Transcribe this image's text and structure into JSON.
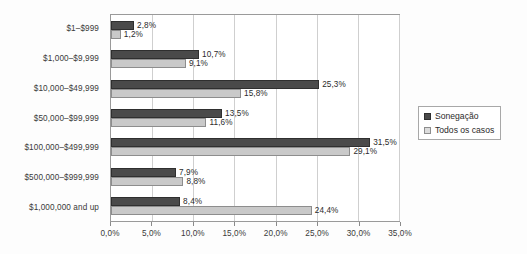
{
  "chart_data": {
    "type": "bar",
    "orientation": "horizontal",
    "title": "",
    "subtitle": "",
    "xlabel": "",
    "ylabel": "",
    "xlim": [
      0,
      35
    ],
    "grid": true,
    "legend_position": "right",
    "categories": [
      "$1–$999",
      "$1,000–$9,999",
      "$10,000–$49,999",
      "$50,000–$99,999",
      "$100,000–$499,999",
      "$500,000–$999,999",
      "$1,000,000 and up"
    ],
    "xticks": [
      0,
      5,
      10,
      15,
      20,
      25,
      30,
      35
    ],
    "xtick_labels": [
      "0,0%",
      "5,0%",
      "10,0%",
      "15,0%",
      "20,0%",
      "25,0%",
      "30,0%",
      "35,0%"
    ],
    "series": [
      {
        "name": "Sonegação",
        "color": "#4a4a4a",
        "values": [
          2.8,
          10.7,
          25.3,
          13.5,
          31.5,
          7.9,
          8.4
        ],
        "labels": [
          "2,8%",
          "10,7%",
          "25,3%",
          "13,5%",
          "31,5%",
          "7,9%",
          "8,4%"
        ]
      },
      {
        "name": "Todos os casos",
        "color": "#c9c9c9",
        "values": [
          1.2,
          9.1,
          15.8,
          11.6,
          29.1,
          8.8,
          24.4
        ],
        "labels": [
          "1,2%",
          "9,1%",
          "15,8%",
          "11,6%",
          "29,1%",
          "8,8%",
          "24,4%"
        ]
      }
    ]
  },
  "legend": {
    "items": [
      {
        "label": "Sonegação"
      },
      {
        "label": "Todos os casos"
      }
    ]
  }
}
